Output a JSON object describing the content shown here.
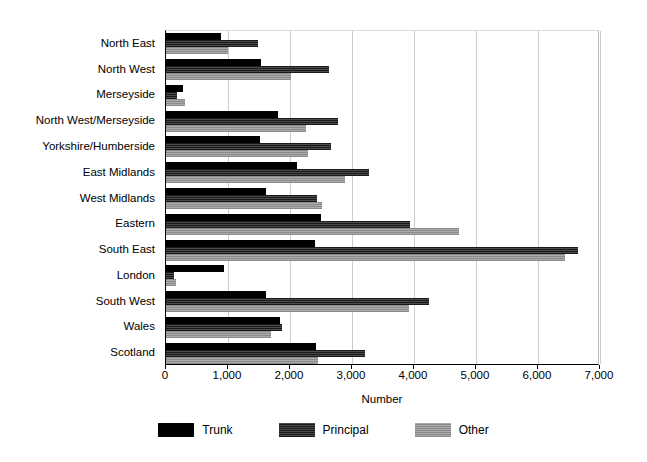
{
  "chart_data": {
    "type": "bar",
    "orientation": "horizontal",
    "title": "",
    "xlabel": "Number",
    "ylabel": "",
    "xlim": [
      0,
      7000
    ],
    "xticks": [
      0,
      1000,
      2000,
      3000,
      4000,
      5000,
      6000,
      7000
    ],
    "xtick_labels": [
      "0",
      "1,000",
      "2,000",
      "3,000",
      "4,000",
      "5,000",
      "6,000",
      "7,000"
    ],
    "grid": "vertical",
    "legend_position": "bottom-center",
    "categories": [
      "North East",
      "North West",
      "Merseyside",
      "North West/Merseyside",
      "Yorkshire/Humberside",
      "East Midlands",
      "West Midlands",
      "Eastern",
      "South East",
      "London",
      "South West",
      "Wales",
      "Scotland"
    ],
    "series": [
      {
        "name": "Trunk",
        "color": "#000000",
        "values": [
          880,
          1530,
          280,
          1800,
          1510,
          2120,
          1620,
          2500,
          2400,
          930,
          1610,
          1840,
          2420
        ]
      },
      {
        "name": "Principal",
        "color": "#2e2e2e",
        "values": [
          1480,
          2630,
          180,
          2770,
          2660,
          3270,
          2430,
          3940,
          6650,
          130,
          4240,
          1870,
          3210
        ]
      },
      {
        "name": "Other",
        "color": "#9a9a9a",
        "values": [
          1000,
          2015,
          310,
          2250,
          2290,
          2880,
          2510,
          4730,
          6440,
          160,
          3920,
          1690,
          2450
        ]
      }
    ]
  },
  "legend": {
    "items": [
      {
        "label": "Trunk",
        "swatch": "trunk"
      },
      {
        "label": "Principal",
        "swatch": "principal"
      },
      {
        "label": "Other",
        "swatch": "other"
      }
    ]
  }
}
